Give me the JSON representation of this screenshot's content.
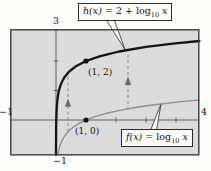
{
  "figure": {
    "colors": {
      "page_bg": "#fdfdfb",
      "plot_bg": "#dcdcdc",
      "h_curve": "#141414",
      "f_curve": "#8e8e8e",
      "axis": "#5e5e5e",
      "border": "#474747",
      "arrow": "#8f8f8f",
      "arrow_head": "#6e6e6e",
      "text": "#111111",
      "box_bg": "#fbfbf8",
      "box_border": "#2a2a2a"
    }
  },
  "labels": {
    "h_box": {
      "func": "h(x)",
      "eq": " = 2 + ",
      "op": "log",
      "sub": "10",
      "arg": " x"
    },
    "f_box": {
      "func": "f(x)",
      "eq": " = ",
      "op": "log",
      "sub": "10",
      "arg": " x"
    },
    "y_max": "3",
    "y_min": "−1",
    "x_min": "−1",
    "x_max": "4"
  },
  "chart_data": {
    "type": "line",
    "xlim": [
      -1,
      4
    ],
    "ylim": [
      -1,
      3
    ],
    "grid": false,
    "x_axis_ticks": [
      2,
      3,
      4
    ],
    "y_axis_ticks": [
      1,
      2
    ],
    "axis_end_labels": {
      "x_left": "−1",
      "x_right": "4",
      "y_top": "3",
      "y_bottom": "−1"
    },
    "series": [
      {
        "name": "h(x) = 2 + log10 x",
        "formula": "h(x) = 2 + log10(x)",
        "style": "thick-black",
        "points": [
          [
            0.00065,
            -1.187
          ],
          [
            0.001,
            -1.0
          ],
          [
            0.0015,
            -0.824
          ],
          [
            0.0022,
            -0.658
          ],
          [
            0.0033,
            -0.481
          ],
          [
            0.005,
            -0.301
          ],
          [
            0.0075,
            -0.125
          ],
          [
            0.011,
            0.041
          ],
          [
            0.017,
            0.23
          ],
          [
            0.025,
            0.398
          ],
          [
            0.038,
            0.58
          ],
          [
            0.057,
            0.756
          ],
          [
            0.085,
            0.929
          ],
          [
            0.13,
            1.114
          ],
          [
            0.19,
            1.279
          ],
          [
            0.29,
            1.462
          ],
          [
            0.43,
            1.633
          ],
          [
            0.65,
            1.813
          ],
          [
            1.0,
            2.0
          ],
          [
            1.45,
            2.161
          ],
          [
            2.1,
            2.322
          ],
          [
            3.0,
            2.477
          ],
          [
            3.9,
            2.591
          ],
          [
            4.78,
            2.679
          ]
        ]
      },
      {
        "name": "f(x) = log10 x",
        "formula": "f(x) = log10(x)",
        "style": "thin-gray",
        "points": [
          [
            0.065,
            -1.187
          ],
          [
            0.085,
            -1.071
          ],
          [
            0.105,
            -0.979
          ],
          [
            0.13,
            -0.886
          ],
          [
            0.165,
            -0.783
          ],
          [
            0.21,
            -0.678
          ],
          [
            0.27,
            -0.569
          ],
          [
            0.35,
            -0.456
          ],
          [
            0.45,
            -0.347
          ],
          [
            0.6,
            -0.222
          ],
          [
            0.8,
            -0.097
          ],
          [
            1.0,
            0.0
          ],
          [
            1.3,
            0.114
          ],
          [
            1.7,
            0.23
          ],
          [
            2.2,
            0.342
          ],
          [
            2.8,
            0.447
          ],
          [
            3.5,
            0.544
          ],
          [
            4.1,
            0.613
          ],
          [
            4.78,
            0.679
          ]
        ]
      }
    ],
    "marked_points": [
      {
        "x": 1,
        "y": 2,
        "label": "(1, 2)",
        "on": "h"
      },
      {
        "x": 1,
        "y": 0,
        "label": "(1, 0)",
        "on": "f"
      }
    ],
    "shift_arrows": [
      {
        "x": 0.4,
        "from_y": -0.4,
        "to_y": 1.55,
        "direction": "up"
      },
      {
        "x": 2.4,
        "from_y": 0.35,
        "to_y": 2.28,
        "direction": "up"
      }
    ]
  }
}
